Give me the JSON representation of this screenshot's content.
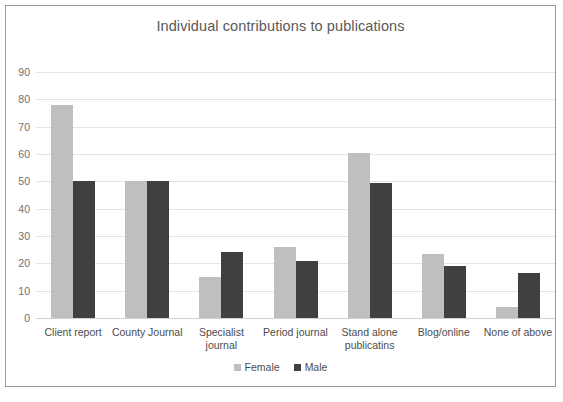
{
  "chart_data": {
    "type": "bar",
    "title": "Individual contributions to publications",
    "xlabel": "",
    "ylabel": "",
    "ylim": [
      0,
      90
    ],
    "yticks": [
      0,
      10,
      20,
      30,
      40,
      50,
      60,
      70,
      80,
      90
    ],
    "grid": true,
    "legend_position": "bottom",
    "categories": [
      "Client report",
      "County Journal",
      "Specialist\njournal",
      "Period journal",
      "Stand alone\npublicatins",
      "Blog/online",
      "None of above"
    ],
    "series": [
      {
        "name": "Female",
        "color": "#bfbfbf",
        "values": [
          78,
          50,
          15,
          26,
          60.5,
          23.5,
          4
        ]
      },
      {
        "name": "Male",
        "color": "#404040",
        "values": [
          50,
          50,
          24,
          21,
          49.5,
          19,
          16.5
        ]
      }
    ]
  },
  "legend": {
    "items": [
      {
        "label": "Female",
        "swatch": "female-color-swatch"
      },
      {
        "label": "Male",
        "swatch": "male-color-swatch"
      }
    ]
  },
  "colors": {
    "female": "#bfbfbf",
    "male": "#404040",
    "gridline": "#e4e4e4",
    "frame_border": "#9a9a9a",
    "title_text": "#59595b",
    "tick_text": "#4c4c4e"
  }
}
